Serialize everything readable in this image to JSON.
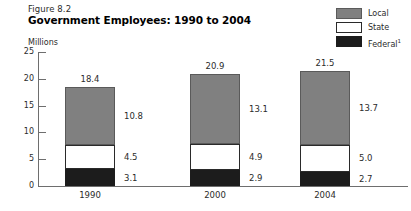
{
  "figure": {
    "number": "Figure 8.2",
    "title": "Government Employees: 1990 to 2004",
    "unit_label": "Millions"
  },
  "legend": {
    "position": "top-right",
    "entries": [
      {
        "label": "Local",
        "color": "#808080",
        "swatch_name": "legend-swatch-local"
      },
      {
        "label": "State",
        "color": "#ffffff",
        "swatch_name": "legend-swatch-state"
      },
      {
        "label": "Federal",
        "footnote": "1",
        "color": "#1c1c1c",
        "swatch_name": "legend-swatch-federal"
      }
    ]
  },
  "axis": {
    "y_ticks": [
      "0",
      "5",
      "10",
      "15",
      "20",
      "25"
    ],
    "y_min": 0,
    "y_max": 25,
    "y_step": 5
  },
  "chart_data": {
    "type": "bar",
    "stacked": true,
    "title": "Government Employees: 1990 to 2004",
    "subtitle": "Figure 8.2",
    "xlabel": "",
    "ylabel": "Millions",
    "ylim": [
      0,
      25
    ],
    "ytick_step": 5,
    "grid": false,
    "legend_position": "top-right",
    "categories": [
      "1990",
      "2000",
      "2004"
    ],
    "series": [
      {
        "name": "Federal",
        "color": "#1c1c1c",
        "values": [
          3.1,
          2.9,
          2.7
        ]
      },
      {
        "name": "State",
        "color": "#ffffff",
        "values": [
          4.5,
          4.9,
          5.0
        ]
      },
      {
        "name": "Local",
        "color": "#808080",
        "values": [
          10.8,
          13.1,
          13.7
        ]
      }
    ],
    "totals": [
      18.4,
      20.9,
      21.5
    ],
    "annotations": {
      "total_labels": [
        "18.4",
        "20.9",
        "21.5"
      ],
      "segment_labels": {
        "1990": {
          "Local": "10.8",
          "State": "4.5",
          "Federal": "3.1"
        },
        "2000": {
          "Local": "13.1",
          "State": "4.9",
          "Federal": "2.9"
        },
        "2004": {
          "Local": "13.7",
          "State": "5.0",
          "Federal": "2.7"
        }
      }
    }
  }
}
